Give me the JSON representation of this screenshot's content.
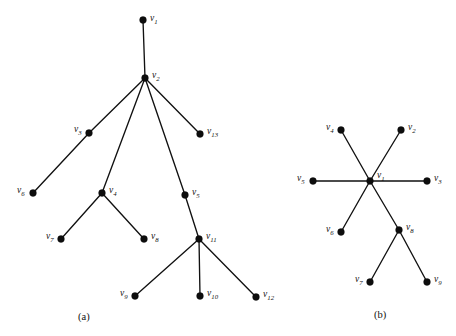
{
  "figure": {
    "background_color": "#ffffff",
    "ink_color": "#111111",
    "width": 456,
    "height": 336,
    "panels": [
      {
        "id": "panel-a",
        "caption": "(a)",
        "caption_x": 78,
        "caption_y": 312,
        "node_radius": 3.4,
        "nodes": [
          {
            "id": "v1",
            "label": "v",
            "sub": "1",
            "x": 143,
            "y": 20,
            "label_x": 150,
            "label_y": 14
          },
          {
            "id": "v2",
            "label": "v",
            "sub": "2",
            "x": 145,
            "y": 78,
            "label_x": 152,
            "label_y": 71
          },
          {
            "id": "v3",
            "label": "v",
            "sub": "3",
            "x": 89,
            "y": 133,
            "label_x": 74,
            "label_y": 125
          },
          {
            "id": "v4",
            "label": "v",
            "sub": "4",
            "x": 102,
            "y": 193,
            "label_x": 109,
            "label_y": 186
          },
          {
            "id": "v5",
            "label": "v",
            "sub": "5",
            "x": 185,
            "y": 195,
            "label_x": 192,
            "label_y": 188
          },
          {
            "id": "v6",
            "label": "v",
            "sub": "6",
            "x": 33,
            "y": 193,
            "label_x": 17,
            "label_y": 186
          },
          {
            "id": "v7",
            "label": "v",
            "sub": "7",
            "x": 61,
            "y": 239,
            "label_x": 46,
            "label_y": 232
          },
          {
            "id": "v8",
            "label": "v",
            "sub": "8",
            "x": 144,
            "y": 239,
            "label_x": 151,
            "label_y": 232
          },
          {
            "id": "v9",
            "label": "v",
            "sub": "9",
            "x": 135,
            "y": 296,
            "label_x": 120,
            "label_y": 289
          },
          {
            "id": "v10",
            "label": "v",
            "sub": "10",
            "x": 200,
            "y": 296,
            "label_x": 207,
            "label_y": 289
          },
          {
            "id": "v11",
            "label": "v",
            "sub": "11",
            "x": 199,
            "y": 239,
            "label_x": 206,
            "label_y": 232
          },
          {
            "id": "v12",
            "label": "v",
            "sub": "12",
            "x": 256,
            "y": 297,
            "label_x": 263,
            "label_y": 290
          },
          {
            "id": "v13",
            "label": "v",
            "sub": "13",
            "x": 200,
            "y": 134,
            "label_x": 207,
            "label_y": 127
          }
        ],
        "edges": [
          [
            "v1",
            "v2"
          ],
          [
            "v2",
            "v3"
          ],
          [
            "v2",
            "v4"
          ],
          [
            "v2",
            "v5"
          ],
          [
            "v2",
            "v13"
          ],
          [
            "v3",
            "v6"
          ],
          [
            "v4",
            "v7"
          ],
          [
            "v4",
            "v8"
          ],
          [
            "v5",
            "v11"
          ],
          [
            "v11",
            "v9"
          ],
          [
            "v11",
            "v10"
          ],
          [
            "v11",
            "v12"
          ]
        ]
      },
      {
        "id": "panel-b",
        "caption": "(b)",
        "caption_x": 374,
        "caption_y": 310,
        "node_radius": 3.4,
        "nodes": [
          {
            "id": "v1",
            "label": "v",
            "sub": "1",
            "x": 370,
            "y": 181,
            "label_x": 377,
            "label_y": 171
          },
          {
            "id": "v2",
            "label": "v",
            "sub": "2",
            "x": 401,
            "y": 130,
            "label_x": 408,
            "label_y": 123
          },
          {
            "id": "v3",
            "label": "v",
            "sub": "3",
            "x": 427,
            "y": 181,
            "label_x": 434,
            "label_y": 174
          },
          {
            "id": "v4",
            "label": "v",
            "sub": "4",
            "x": 341,
            "y": 130,
            "label_x": 326,
            "label_y": 123
          },
          {
            "id": "v5",
            "label": "v",
            "sub": "5",
            "x": 313,
            "y": 181,
            "label_x": 297,
            "label_y": 174
          },
          {
            "id": "v6",
            "label": "v",
            "sub": "6",
            "x": 341,
            "y": 232,
            "label_x": 326,
            "label_y": 225
          },
          {
            "id": "v7",
            "label": "v",
            "sub": "7",
            "x": 370,
            "y": 282,
            "label_x": 355,
            "label_y": 275
          },
          {
            "id": "v8",
            "label": "v",
            "sub": "8",
            "x": 399,
            "y": 230,
            "label_x": 406,
            "label_y": 223
          },
          {
            "id": "v9",
            "label": "v",
            "sub": "9",
            "x": 427,
            "y": 282,
            "label_x": 434,
            "label_y": 275
          }
        ],
        "edges": [
          [
            "v1",
            "v2"
          ],
          [
            "v1",
            "v3"
          ],
          [
            "v1",
            "v4"
          ],
          [
            "v1",
            "v5"
          ],
          [
            "v1",
            "v6"
          ],
          [
            "v1",
            "v8"
          ],
          [
            "v8",
            "v7"
          ],
          [
            "v8",
            "v9"
          ]
        ]
      }
    ]
  }
}
